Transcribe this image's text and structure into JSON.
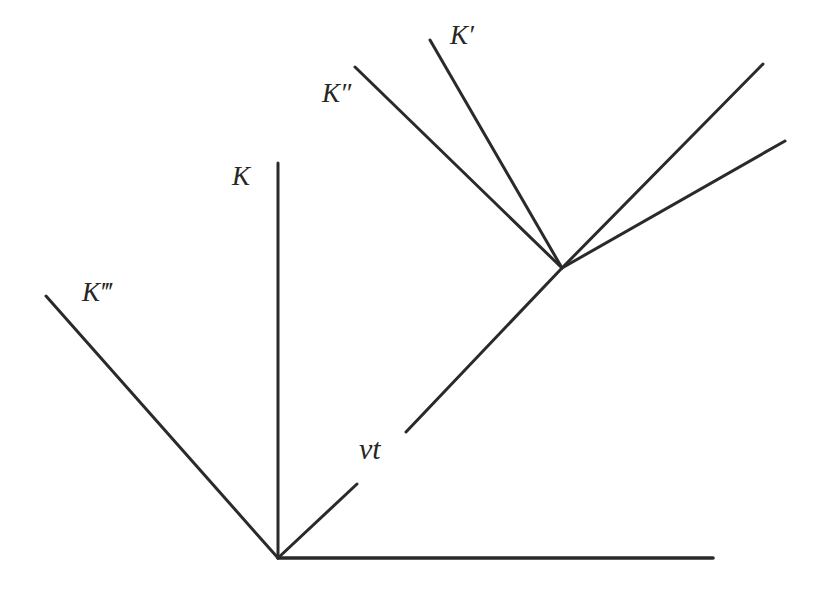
{
  "figure": {
    "background_color": "#ffffff",
    "stroke_color": "#2a2a2a",
    "stroke_width": 3,
    "width": 825,
    "height": 590
  },
  "labels": {
    "K": "K",
    "K_prime": "K′",
    "K_double_prime": "K″",
    "K_triple_prime": "K‴",
    "vt": "vt"
  },
  "chart_data": {
    "type": "line",
    "xlabel": "",
    "ylabel": "",
    "grid": false,
    "legend": "none",
    "xlim": [
      0,
      825
    ],
    "ylim": [
      590,
      0
    ],
    "annotations": [
      {
        "name": "K",
        "text": "K",
        "x": 243,
        "y": 180,
        "italic": true
      },
      {
        "name": "K-prime",
        "text": "K′",
        "x": 462,
        "y": 39,
        "italic": true
      },
      {
        "name": "K-double-prime",
        "text": "K″",
        "x": 337,
        "y": 97,
        "italic": true
      },
      {
        "name": "K-triple-prime",
        "text": "K‴",
        "x": 102,
        "y": 296,
        "italic": true
      },
      {
        "name": "vt",
        "text": "vt",
        "x": 375,
        "y": 452,
        "italic": true
      }
    ],
    "series": [
      {
        "name": "origin-horizontal-axis",
        "x": [
          278,
          713
        ],
        "y": [
          558,
          558
        ]
      },
      {
        "name": "K-vertical-axis",
        "x": [
          278,
          278
        ],
        "y": [
          558,
          163
        ]
      },
      {
        "name": "K-triple-prime-axis",
        "x": [
          278,
          46
        ],
        "y": [
          558,
          296
        ]
      },
      {
        "name": "vt-short-segment",
        "x": [
          278,
          357
        ],
        "y": [
          558,
          484
        ]
      },
      {
        "name": "vt-long-diagonal-to-vertex",
        "x": [
          406,
          562
        ],
        "y": [
          432,
          268
        ]
      },
      {
        "name": "K-double-prime-axis",
        "x": [
          562,
          355
        ],
        "y": [
          268,
          67
        ]
      },
      {
        "name": "K-prime-axis",
        "x": [
          562,
          430
        ],
        "y": [
          268,
          40
        ]
      },
      {
        "name": "vertex-upper-right-steep",
        "x": [
          562,
          763
        ],
        "y": [
          268,
          64
        ]
      },
      {
        "name": "vertex-upper-right-shallow",
        "x": [
          562,
          785
        ],
        "y": [
          268,
          141
        ]
      }
    ]
  }
}
